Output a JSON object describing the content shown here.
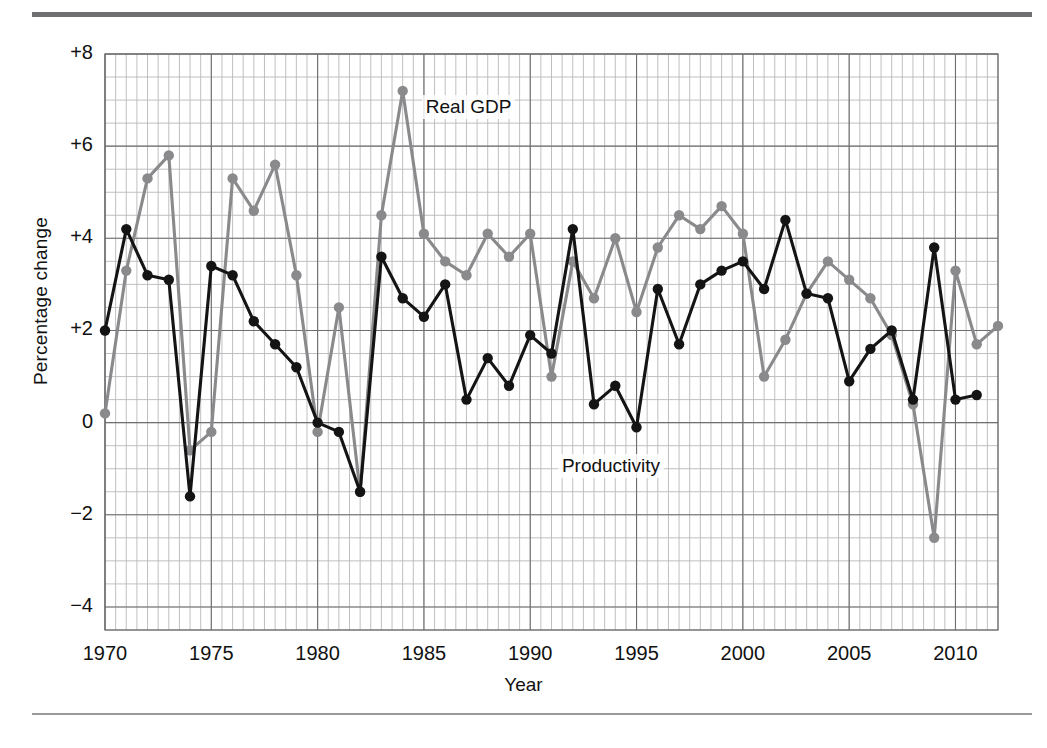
{
  "figure": {
    "ylabel": "Percentage change",
    "xlabel": "Year"
  },
  "axis": {
    "yticks": [
      "+8",
      "+6",
      "+4",
      "+2",
      "0",
      "−2",
      "−4"
    ],
    "ytick_values": [
      8,
      6,
      4,
      2,
      0,
      -2,
      -4
    ],
    "xticks": [
      "1970",
      "1975",
      "1980",
      "1985",
      "1990",
      "1995",
      "2000",
      "2005",
      "2010"
    ],
    "xtick_values": [
      1970,
      1975,
      1980,
      1985,
      1990,
      1995,
      2000,
      2005,
      2010
    ]
  },
  "annotations": [
    {
      "text": "Real GDP",
      "x": 1984.9,
      "y": 6.85
    },
    {
      "text": "Productivity",
      "x": 1991.3,
      "y": -0.95
    }
  ],
  "colors": {
    "real_gdp": "#8a8a8c",
    "productivity": "#141414",
    "grid_minor": "#b9b9bb",
    "grid_major": "#6e6e70",
    "rule": "#6f6f71"
  },
  "chart_data": {
    "type": "line",
    "title": "",
    "xlabel": "Year",
    "ylabel": "Percentage change",
    "xlim": [
      1970,
      2012
    ],
    "ylim": [
      -4.5,
      8
    ],
    "grid": true,
    "grid_minor_x": 0.5,
    "grid_minor_y": 0.5,
    "grid_major_x": 5,
    "grid_major_y": 2,
    "legend": "inline-annotations",
    "x": [
      1970,
      1971,
      1972,
      1973,
      1974,
      1975,
      1976,
      1977,
      1978,
      1979,
      1980,
      1981,
      1982,
      1983,
      1984,
      1985,
      1986,
      1987,
      1988,
      1989,
      1990,
      1991,
      1992,
      1993,
      1994,
      1995,
      1996,
      1997,
      1998,
      1999,
      2000,
      2001,
      2002,
      2003,
      2004,
      2005,
      2006,
      2007,
      2008,
      2009,
      2010,
      2011,
      2012
    ],
    "series": [
      {
        "name": "Real GDP",
        "color": "#8a8a8c",
        "values": [
          0.2,
          3.3,
          5.3,
          5.8,
          -0.6,
          -0.2,
          5.3,
          4.6,
          5.6,
          3.2,
          -0.2,
          2.5,
          -1.5,
          4.5,
          7.2,
          4.1,
          3.5,
          3.2,
          4.1,
          3.6,
          4.1,
          1.0,
          3.5,
          2.7,
          4.0,
          2.4,
          3.8,
          4.5,
          4.2,
          4.7,
          4.1,
          1.0,
          1.8,
          2.8,
          3.5,
          3.1,
          2.7,
          1.9,
          0.4,
          -2.5,
          3.3,
          1.7,
          2.1
        ]
      },
      {
        "name": "Productivity",
        "color": "#141414",
        "values": [
          2.0,
          4.2,
          3.2,
          3.1,
          -1.6,
          3.4,
          3.2,
          2.2,
          1.7,
          1.2,
          0.0,
          -0.2,
          -1.5,
          3.6,
          2.7,
          2.3,
          3.0,
          0.5,
          1.4,
          0.8,
          1.9,
          1.5,
          4.2,
          0.4,
          0.8,
          -0.1,
          2.9,
          1.7,
          3.0,
          3.3,
          3.5,
          2.9,
          4.4,
          2.8,
          2.7,
          0.9,
          1.6,
          2.0,
          0.5,
          3.8,
          0.5,
          0.6,
          null
        ]
      }
    ]
  }
}
